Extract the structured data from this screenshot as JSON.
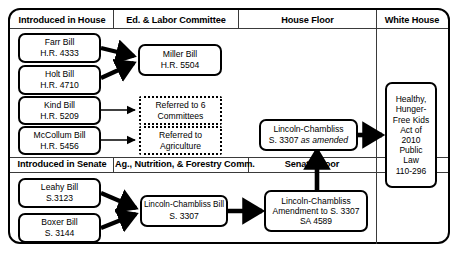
{
  "diagram": {
    "headers": {
      "house_intro": "Introduced in House",
      "ed_labor": "Ed. & Labor Committee",
      "house_floor": "House Floor",
      "white_house": "White House",
      "senate_intro": "Introduced in Senate",
      "ag_comm": "Ag., Nutrition, & Forestry Comm.",
      "senate_floor": "Senate Floor"
    },
    "nodes": {
      "farr": {
        "line1": "Farr Bill",
        "line2": "H.R. 4333"
      },
      "holt": {
        "line1": "Holt Bill",
        "line2": "H.R. 4710"
      },
      "kind": {
        "line1": "Kind Bill",
        "line2": "H.R. 5209"
      },
      "mccollum": {
        "line1": "McCollum Bill",
        "line2": "H.R. 5456"
      },
      "miller": {
        "line1": "Miller Bill",
        "line2": "H.R. 5504"
      },
      "referred6": {
        "line1": "Referred to 6",
        "line2": "Committees"
      },
      "referredag": {
        "line1": "Referred to",
        "line2": "Agriculture"
      },
      "leahy": {
        "line1": "Leahy Bill",
        "line2": "S.3123"
      },
      "boxer": {
        "line1": "Boxer Bill",
        "line2": "S. 3144"
      },
      "lc_bill": {
        "line1": "Lincoln-Chambliss Bill",
        "line2": "S. 3307"
      },
      "lc_amendment": {
        "line1": "Lincoln-Chambliss",
        "line2": "Amendment to S. 3307",
        "line3": "SA 4589"
      },
      "lc_amended": {
        "line1": "Lincoln-Chambliss",
        "line2_pre": "S. 3307 ",
        "line2_italic": "as amended"
      },
      "public_law": {
        "line1": "Healthy,",
        "line2": "Hunger-",
        "line3": "Free Kids",
        "line4": "Act of",
        "line5": "2010",
        "line6": "Public",
        "line7": "Law",
        "line8": "110-296"
      }
    },
    "colors": {
      "stroke": "#000000",
      "background": "#ffffff",
      "divider": "#3a3a3a"
    }
  }
}
